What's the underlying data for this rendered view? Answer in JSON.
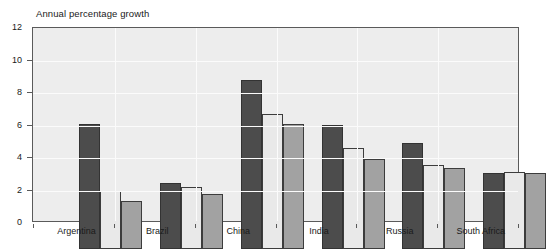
{
  "chart_data": {
    "type": "bar",
    "title": "Annual percentage growth",
    "subtitle": "",
    "xlabel": "",
    "ylabel": "",
    "ylim": [
      0,
      12
    ],
    "yticks": [
      0,
      2,
      4,
      6,
      8,
      10,
      12
    ],
    "ytick_labels": [
      "0",
      "2",
      "4",
      "6",
      "8",
      "10",
      "12"
    ],
    "categories": [
      "Argentina",
      "Brazil",
      "China",
      "India",
      "Russia",
      "South Africa"
    ],
    "grid": "horizontal-and-vertical-white",
    "legend": "none",
    "series": [
      {
        "name": "series-1",
        "color": "#4c4c4c",
        "values": [
          7.8,
          4.1,
          10.5,
          7.7,
          6.6,
          4.75
        ]
      },
      {
        "name": "series-2",
        "color": "#e9e9e9",
        "values": [
          3.6,
          3.85,
          8.4,
          6.25,
          5.2,
          4.8
        ]
      },
      {
        "name": "series-3",
        "color": "#a2a2a2",
        "values": [
          3.0,
          3.45,
          7.8,
          5.6,
          5.05,
          4.7
        ]
      }
    ]
  },
  "plot": {
    "background_color": "#ededed",
    "frame_color": "#5a5a5a",
    "gridline_color": "#fbfbfb"
  }
}
